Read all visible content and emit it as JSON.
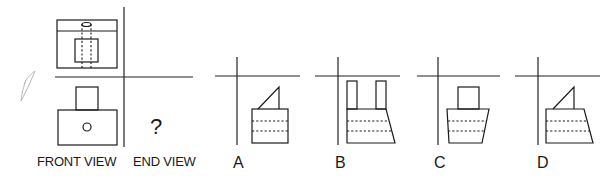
{
  "problem": {
    "type": "orthographic-projection",
    "question_mark": "?",
    "labels": {
      "front_view": "FRONT VIEW",
      "end_view": "END VIEW"
    }
  },
  "options": [
    {
      "id": "A",
      "label": "A",
      "description": "Rectangle with two hidden lines, triangular wedge on top"
    },
    {
      "id": "B",
      "label": "B",
      "description": "Trapezoid slanting out at bottom-right, two posts on top"
    },
    {
      "id": "C",
      "label": "C",
      "description": "Trapezoid slanting in at bottom-right, single block on top"
    },
    {
      "id": "D",
      "label": "D",
      "description": "Trapezoid slanting out at bottom-right, triangular wedge on top"
    }
  ],
  "colors": {
    "line": "#1a1a1a",
    "pencil_mark": "#b8b8b8",
    "background": "#ffffff"
  }
}
